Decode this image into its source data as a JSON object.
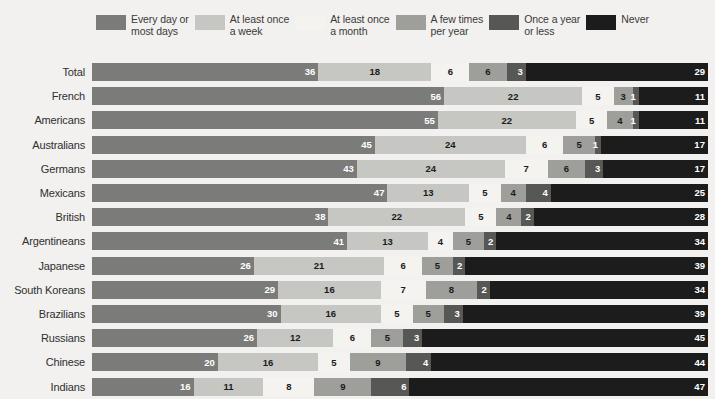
{
  "chart_data": {
    "type": "bar",
    "subtype": "stacked-horizontal-100",
    "title": "",
    "xlabel": "",
    "ylabel": "",
    "xlim": [
      0,
      100
    ],
    "grid": false,
    "legend_position": "top",
    "categories": [
      "Total",
      "French",
      "Americans",
      "Australians",
      "Germans",
      "Mexicans",
      "British",
      "Argentineans",
      "Japanese",
      "South Koreans",
      "Brazilians",
      "Russians",
      "Chinese",
      "Indians"
    ],
    "series": [
      {
        "name": "Every day or most days",
        "color": "#7b7b79",
        "values": [
          36,
          56,
          55,
          45,
          43,
          47,
          38,
          41,
          26,
          29,
          30,
          26,
          20,
          16
        ]
      },
      {
        "name": "At least once a week",
        "color": "#c6c6c2",
        "values": [
          18,
          22,
          22,
          24,
          24,
          13,
          22,
          13,
          21,
          16,
          16,
          12,
          16,
          11
        ]
      },
      {
        "name": "At least once a month",
        "color": "#f4f3ef",
        "values": [
          6,
          5,
          5,
          6,
          7,
          5,
          5,
          4,
          6,
          7,
          5,
          6,
          5,
          8
        ]
      },
      {
        "name": "A few times per year",
        "color": "#9e9e9b",
        "values": [
          6,
          3,
          4,
          5,
          6,
          4,
          4,
          5,
          5,
          8,
          5,
          5,
          9,
          9
        ]
      },
      {
        "name": "Once a year or less",
        "color": "#575756",
        "values": [
          3,
          1,
          1,
          1,
          3,
          4,
          2,
          2,
          2,
          2,
          3,
          3,
          4,
          6
        ]
      },
      {
        "name": "Never",
        "color": "#1c1c1c",
        "values": [
          29,
          11,
          11,
          17,
          17,
          25,
          28,
          34,
          39,
          34,
          39,
          45,
          44,
          47
        ]
      }
    ]
  },
  "legend": {
    "items": [
      {
        "label": "Every day or\nmost days",
        "color": "#7b7b79"
      },
      {
        "label": "At least once\na week",
        "color": "#c6c6c2"
      },
      {
        "label": "At least once\na month",
        "color": "#f4f3ef"
      },
      {
        "label": "A few times\nper year",
        "color": "#9e9e9b"
      },
      {
        "label": "Once a year\nor less",
        "color": "#575756"
      },
      {
        "label": "Never",
        "color": "#1c1c1c"
      }
    ]
  },
  "theme": {
    "background": "#f2f1ef",
    "label_color": "#2f2f2d",
    "value_light": "#ffffff",
    "value_dark": "#1b1b1b"
  }
}
